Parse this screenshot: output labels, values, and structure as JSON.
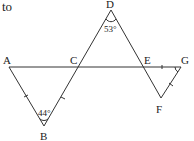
{
  "header_text": "to",
  "points": {
    "A": {
      "label": "A",
      "x": 9,
      "y": 67
    },
    "B": {
      "label": "B",
      "x": 44,
      "y": 126
    },
    "C": {
      "label": "C",
      "x": 79,
      "y": 67
    },
    "D": {
      "label": "D",
      "x": 111,
      "y": 10
    },
    "E": {
      "label": "E",
      "x": 144,
      "y": 67
    },
    "F": {
      "label": "F",
      "x": 161,
      "y": 98
    },
    "G": {
      "label": "G",
      "x": 181,
      "y": 67
    }
  },
  "angles": {
    "D": "53°",
    "B": "44°"
  },
  "colors": {
    "line": "#333333",
    "text": "#222222"
  }
}
